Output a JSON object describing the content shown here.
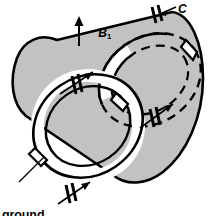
{
  "figure": {
    "width": 216,
    "height": 216,
    "background": "#ffffff"
  },
  "colors": {
    "cylinder_fill": "#c2c2c2",
    "ring_fill": "#ffffff",
    "stroke": "#000000",
    "label": "#000000"
  },
  "labels": {
    "b1_symbol": "B",
    "b1_subscript": "1",
    "capacitor_symbol": "C",
    "ground_ring_line1": "ground",
    "ground_ring_line2": "ring"
  },
  "annotations": [
    {
      "name": "b1-field-arrow",
      "label": "B1",
      "direction": "up",
      "x": 78,
      "y": 20
    },
    {
      "name": "capacitor-label-c",
      "label": "C",
      "x": 178,
      "y": 3
    },
    {
      "name": "ground-ring-callout",
      "label": "ground ring",
      "x": 2,
      "y": 183
    }
  ],
  "capacitors": [
    {
      "name": "capacitor-top-right",
      "ring": "right-ring",
      "position": "top",
      "hidden": false
    },
    {
      "name": "capacitor-left-upper",
      "ring": "left-ring",
      "position": "upper-left",
      "hidden": false
    },
    {
      "name": "capacitor-right-lower",
      "ring": "right-ring",
      "position": "lower",
      "hidden": true
    },
    {
      "name": "capacitor-left-bottom",
      "ring": "left-ring",
      "position": "bottom",
      "hidden": false
    }
  ],
  "elements": {
    "cylinder": "grey shaded oblique cylinder",
    "left_ring": "white annular end ring (ground ring)",
    "right_ring": "white annular end ring with capacitors",
    "hidden_edges": "dashed arcs behind cylinder"
  }
}
